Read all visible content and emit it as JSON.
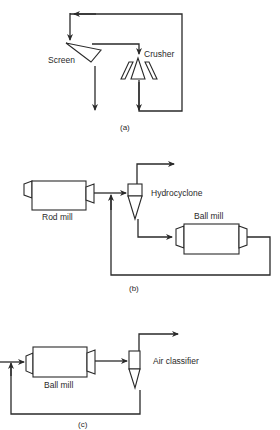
{
  "diagram": {
    "panels": [
      {
        "id": "a",
        "caption": "(a)",
        "components": {
          "screen": "Screen",
          "crusher": "Crusher"
        }
      },
      {
        "id": "b",
        "caption": "(b)",
        "components": {
          "rod_mill": "Rod mill",
          "hydrocyclone": "Hydrocyclone",
          "ball_mill": "Ball mill"
        }
      },
      {
        "id": "c",
        "caption": "(c)",
        "components": {
          "ball_mill": "Ball mill",
          "air_classifier": "Air classifier"
        }
      }
    ],
    "colors": {
      "line": "#2a2a2a",
      "background": "#ffffff"
    }
  }
}
